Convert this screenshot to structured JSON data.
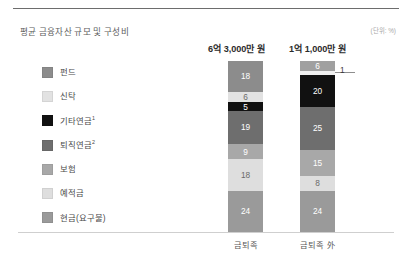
{
  "figure": {
    "title": "평균 금융자산 규모 및 구성비",
    "unit_note": "(단위: %)"
  },
  "legend": {
    "items": [
      {
        "label": "펀드",
        "sup": "",
        "color": "#8c8c8c"
      },
      {
        "label": "신탁",
        "sup": "",
        "color": "#e2e2e2"
      },
      {
        "label": "기타연금",
        "sup": "1",
        "color": "#111111"
      },
      {
        "label": "퇴직연금",
        "sup": "2",
        "color": "#6e6e6e"
      },
      {
        "label": "보험",
        "sup": "",
        "color": "#a8a8a8"
      },
      {
        "label": "예적금",
        "sup": "",
        "color": "#dedede"
      },
      {
        "label": "현금(요구불)",
        "sup": "",
        "color": "#9a9a9a"
      }
    ]
  },
  "columns": [
    {
      "header": "6억 3,000만 원",
      "category": "금퇴족"
    },
    {
      "header": "1억 1,000만 원",
      "category": "금퇴족 外"
    }
  ],
  "chart_data": {
    "type": "bar",
    "title": "평균 금융자산 규모 및 구성비",
    "xlabel": "",
    "ylabel": "",
    "ylim": [
      0,
      100
    ],
    "grid": false,
    "legend_position": "left",
    "stacked": true,
    "orientation": "vertical",
    "unit": "%",
    "categories": [
      "금퇴족",
      "금퇴족 外"
    ],
    "category_totals_label": [
      "6억 3,000만 원",
      "1억 1,000만 원"
    ],
    "series": [
      {
        "name": "펀드",
        "values": [
          18,
          6
        ],
        "color": "#8c8c8c"
      },
      {
        "name": "신탁",
        "values": [
          6,
          1
        ],
        "color": "#e2e2e2"
      },
      {
        "name": "기타연금",
        "values": [
          5,
          20
        ],
        "color": "#111111"
      },
      {
        "name": "퇴직연금",
        "values": [
          19,
          25
        ],
        "color": "#6e6e6e"
      },
      {
        "name": "보험",
        "values": [
          9,
          15
        ],
        "color": "#a8a8a8"
      },
      {
        "name": "예적금",
        "values": [
          18,
          8
        ],
        "color": "#dedede"
      },
      {
        "name": "현금(요구불)",
        "values": [
          24,
          24
        ],
        "color": "#9a9a9a"
      }
    ],
    "stack_order_top_to_bottom": [
      "펀드",
      "신탁",
      "기타연금",
      "퇴직연금",
      "보험",
      "예적금",
      "현금(요구불)"
    ],
    "bar_1_values_top_to_bottom": [
      18,
      6,
      5,
      19,
      9,
      18,
      24
    ],
    "bar_2_values_top_to_bottom": [
      6,
      1,
      20,
      25,
      15,
      8,
      24
    ],
    "annotations": [
      {
        "text": "1",
        "note": "leader line callout for 신탁 segment of 금퇴족 外"
      }
    ]
  },
  "bars": [
    {
      "segments": [
        {
          "value": "18",
          "color": "#8c8c8c",
          "pct": 18,
          "text_tone": "on-mid",
          "callout": false
        },
        {
          "value": "6",
          "color": "#e2e2e2",
          "pct": 6,
          "text_tone": "on-light",
          "callout": false
        },
        {
          "value": "5",
          "color": "#111111",
          "pct": 5,
          "text_tone": "on-dark",
          "callout": false
        },
        {
          "value": "19",
          "color": "#6e6e6e",
          "pct": 19,
          "text_tone": "on-dark",
          "callout": false
        },
        {
          "value": "9",
          "color": "#a8a8a8",
          "pct": 9,
          "text_tone": "on-mid",
          "callout": false
        },
        {
          "value": "18",
          "color": "#dedede",
          "pct": 18,
          "text_tone": "on-light",
          "callout": false
        },
        {
          "value": "24",
          "color": "#9a9a9a",
          "pct": 24,
          "text_tone": "on-mid",
          "callout": false
        }
      ]
    },
    {
      "segments": [
        {
          "value": "6",
          "color": "#a0a0a0",
          "pct": 6,
          "text_tone": "on-mid",
          "callout": false
        },
        {
          "value": "1",
          "color": "#f0f0f0",
          "pct": 2,
          "text_tone": "on-light",
          "callout": true
        },
        {
          "value": "20",
          "color": "#111111",
          "pct": 19,
          "text_tone": "on-dark",
          "callout": false
        },
        {
          "value": "25",
          "color": "#6e6e6e",
          "pct": 25,
          "text_tone": "on-dark",
          "callout": false
        },
        {
          "value": "15",
          "color": "#a8a8a8",
          "pct": 15,
          "text_tone": "on-mid",
          "callout": false
        },
        {
          "value": "8",
          "color": "#dedede",
          "pct": 9,
          "text_tone": "on-light",
          "callout": false
        },
        {
          "value": "24",
          "color": "#9a9a9a",
          "pct": 24,
          "text_tone": "on-mid",
          "callout": false
        }
      ]
    }
  ]
}
